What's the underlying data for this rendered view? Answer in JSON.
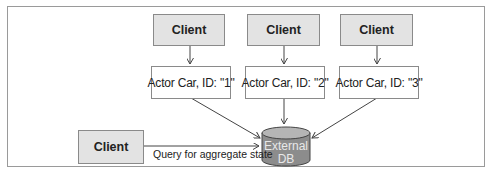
{
  "diagram": {
    "clients_top": [
      {
        "label": "Client"
      },
      {
        "label": "Client"
      },
      {
        "label": "Client"
      }
    ],
    "actors": [
      {
        "label": "Actor Car, ID: \"1\""
      },
      {
        "label": "Actor Car, ID: \"2\""
      },
      {
        "label": "Actor Car, ID: \"3\""
      }
    ],
    "client_bottom": {
      "label": "Client"
    },
    "query_label": "Query for aggregate state",
    "database": {
      "line1": "External",
      "line2": "DB"
    },
    "colors": {
      "client_fill": "#e3e3e3",
      "actor_fill": "#ffffff",
      "db_fill": "#8c8c8c",
      "db_top": "#b5b5b5",
      "stroke": "#555555"
    }
  }
}
